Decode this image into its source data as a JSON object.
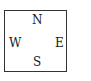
{
  "compass": {
    "north": "N",
    "west": "W",
    "east": "E",
    "south": "S"
  },
  "colors": {
    "border": "#333333",
    "text": "#1a1a1a",
    "background": "#ffffff"
  }
}
